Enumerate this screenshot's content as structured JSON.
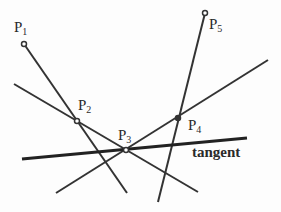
{
  "diagram": {
    "points": [
      {
        "id": "P1",
        "label": "P",
        "sub": "1",
        "x": 24,
        "y": 44
      },
      {
        "id": "P2",
        "label": "P",
        "sub": "2",
        "x": 77,
        "y": 121
      },
      {
        "id": "P3",
        "label": "P",
        "sub": "3",
        "x": 126,
        "y": 150
      },
      {
        "id": "P4",
        "label": "P",
        "sub": "4",
        "x": 178,
        "y": 118
      },
      {
        "id": "P5",
        "label": "P",
        "sub": "5",
        "x": 205,
        "y": 13
      }
    ],
    "lines": [
      {
        "id": "line-p1-p2",
        "x1": 24,
        "y1": 44,
        "x2": 127,
        "y2": 193
      },
      {
        "id": "line-p2-p3",
        "x1": 14,
        "y1": 84,
        "x2": 198,
        "y2": 192
      },
      {
        "id": "line-p3-p4",
        "x1": 56,
        "y1": 193,
        "x2": 268,
        "y2": 60
      },
      {
        "id": "line-p5-p4",
        "x1": 205,
        "y1": 13,
        "x2": 158,
        "y2": 202
      },
      {
        "id": "tangent-line",
        "x1": 22,
        "y1": 159,
        "x2": 247,
        "y2": 138
      }
    ],
    "tangent_label": "tangent",
    "colors": {
      "line": "#333333",
      "text": "#2a2a2a"
    }
  }
}
